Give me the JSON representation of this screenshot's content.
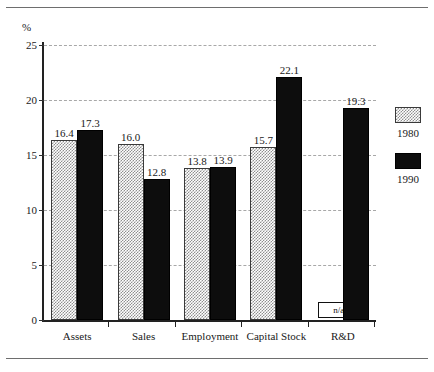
{
  "chart_data": {
    "type": "bar",
    "title": "",
    "xlabel": "",
    "ylabel": "%",
    "ylim": [
      0,
      25
    ],
    "ytick_values": [
      0,
      5,
      10,
      15,
      20,
      25
    ],
    "ytick_labels": [
      "0",
      "5",
      "10",
      "15",
      "20",
      "25"
    ],
    "grid": true,
    "grid_axis": "y",
    "grid_style": "dashed",
    "legend_position": "right",
    "categories": [
      "Assets",
      "Sales",
      "Employment",
      "Capital Stock",
      "R&D"
    ],
    "series": [
      {
        "name": "1980",
        "color": "#8f8f8f",
        "fill": "checkered-gray",
        "values": [
          16.4,
          16.0,
          13.8,
          15.7,
          null
        ],
        "labels": [
          "16.4",
          "16.0",
          "13.8",
          "15.7",
          "n/a"
        ]
      },
      {
        "name": "1990",
        "color": "#0d0d0d",
        "fill": "solid-black",
        "values": [
          17.3,
          12.8,
          13.9,
          22.1,
          19.3
        ],
        "labels": [
          "17.3",
          "12.8",
          "13.9",
          "22.1",
          "19.3"
        ]
      }
    ],
    "missing_marker": "n/a"
  },
  "legend": {
    "entries": [
      {
        "label": "1980",
        "swatch": "gray-checkered-swatch"
      },
      {
        "label": "1990",
        "swatch": "black-solid-swatch"
      }
    ]
  },
  "axis": {
    "unit_label": "%"
  }
}
